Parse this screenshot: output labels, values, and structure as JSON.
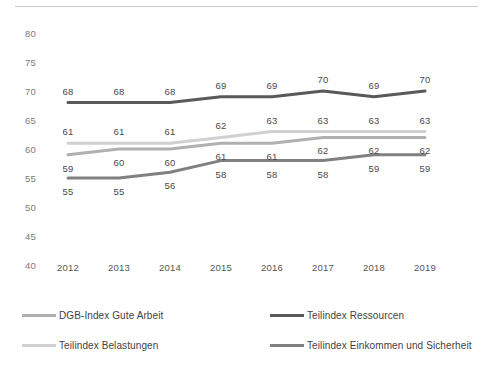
{
  "chart_data": {
    "type": "line",
    "title": "",
    "xlabel": "",
    "ylabel": "",
    "categories": [
      "2012",
      "2013",
      "2014",
      "2015",
      "2016",
      "2017",
      "2018",
      "2019"
    ],
    "ylim": [
      40,
      80
    ],
    "yticks": [
      40,
      45,
      50,
      55,
      60,
      65,
      70,
      75,
      80
    ],
    "grid": false,
    "legend_position": "bottom",
    "series": [
      {
        "name": "Teilindex Ressourcen",
        "color": "#595959",
        "values": [
          68,
          68,
          68,
          69,
          69,
          70,
          69,
          70
        ],
        "label_offset": "above"
      },
      {
        "name": "Teilindex Belastungen",
        "color": "#d0d0d0",
        "values": [
          61,
          61,
          61,
          62,
          63,
          63,
          63,
          63
        ],
        "label_offset": "above"
      },
      {
        "name": "DGB-Index Gute Arbeit",
        "color": "#b0b0b0",
        "values": [
          59,
          60,
          60,
          61,
          61,
          62,
          62,
          62
        ],
        "label_offset": "below"
      },
      {
        "name": "Teilindex Einkommen und Sicherheit",
        "color": "#808080",
        "values": [
          55,
          55,
          56,
          58,
          58,
          58,
          59,
          59
        ],
        "label_offset": "below"
      }
    ]
  },
  "legend": {
    "items": [
      {
        "label": "DGB-Index Gute Arbeit",
        "color": "#b0b0b0",
        "column": "left"
      },
      {
        "label": "Teilindex Belastungen",
        "color": "#d0d0d0",
        "column": "left"
      },
      {
        "label": "Teilindex Ressourcen",
        "color": "#595959",
        "column": "right"
      },
      {
        "label": "Teilindex Einkommen und Sicherheit",
        "color": "#808080",
        "column": "right"
      }
    ]
  }
}
